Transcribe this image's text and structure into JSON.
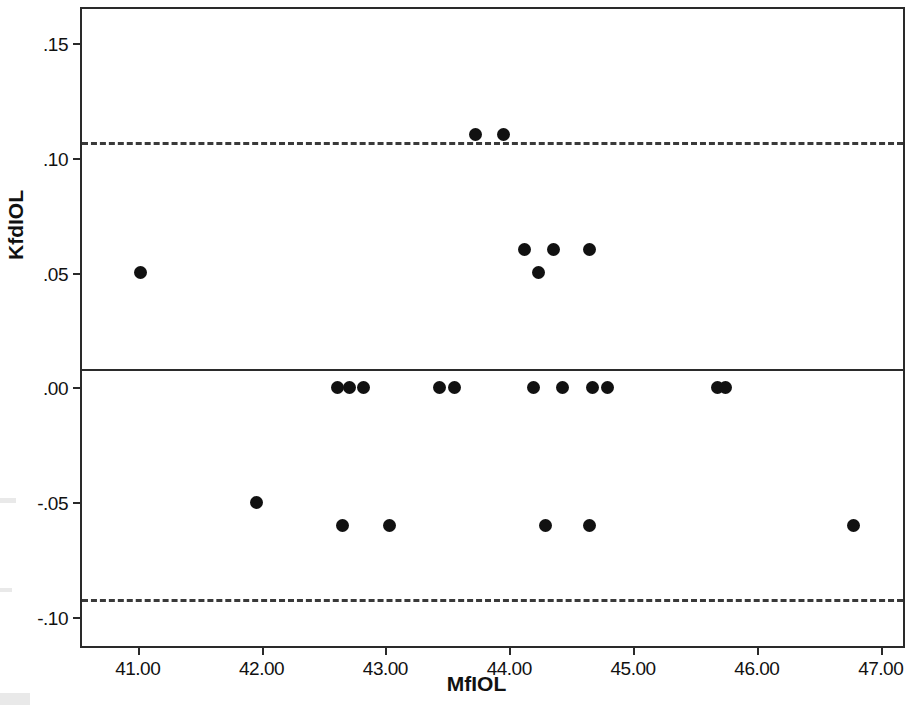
{
  "chart": {
    "type": "scatter",
    "title": "",
    "xlabel": "MfIOL",
    "ylabel": "KfdIOL"
  },
  "axes": {
    "x": {
      "min": 40.55,
      "max": 47.18,
      "ticks": [
        41,
        42,
        43,
        44,
        45,
        46,
        47
      ],
      "tick_labels": [
        "41.00",
        "42.00",
        "43.00",
        "44.00",
        "45.00",
        "46.00",
        "47.00"
      ]
    },
    "y": {
      "min": -0.1125,
      "max": 0.1647,
      "ticks": [
        0.15,
        0.1,
        0.05,
        0.0,
        -0.05,
        -0.1
      ],
      "tick_labels": [
        ".15",
        ".10",
        ".05",
        ".00",
        "-.05",
        "-.10"
      ]
    }
  },
  "reference_lines": [
    {
      "name": "upper-limit-of-agreement",
      "value": 0.107,
      "style": "dashed"
    },
    {
      "name": "mean-difference",
      "value": 0.008,
      "style": "solid"
    },
    {
      "name": "lower-limit-of-agreement",
      "value": -0.092,
      "style": "dashed"
    }
  ],
  "chart_data": {
    "type": "scatter",
    "title": "",
    "xlabel": "MfIOL",
    "ylabel": "KfdIOL",
    "xlim": [
      40.55,
      47.18
    ],
    "ylim": [
      -0.1125,
      0.1647
    ],
    "xticks": [
      41,
      42,
      43,
      44,
      45,
      46,
      47
    ],
    "xtick_labels": [
      "41.00",
      "42.00",
      "43.00",
      "44.00",
      "45.00",
      "46.00",
      "47.00"
    ],
    "yticks": [
      0.15,
      0.1,
      0.05,
      0,
      -0.05,
      -0.1
    ],
    "ytick_labels": [
      ".15",
      ".10",
      ".05",
      ".00",
      "-.05",
      "-.10"
    ],
    "grid": false,
    "legend": "none",
    "marker": "filled-circle",
    "reference_lines": {
      "upper_limit_of_agreement": 0.107,
      "mean": 0.008,
      "lower_limit_of_agreement": -0.092
    },
    "points": [
      {
        "x": 41.02,
        "y": 0.05
      },
      {
        "x": 41.96,
        "y": -0.05
      },
      {
        "x": 42.61,
        "y": 0.0
      },
      {
        "x": 42.71,
        "y": 0.0
      },
      {
        "x": 42.82,
        "y": 0.0
      },
      {
        "x": 42.65,
        "y": -0.06
      },
      {
        "x": 43.03,
        "y": -0.06
      },
      {
        "x": 43.44,
        "y": 0.0
      },
      {
        "x": 43.56,
        "y": 0.0
      },
      {
        "x": 43.73,
        "y": 0.11
      },
      {
        "x": 43.95,
        "y": 0.11
      },
      {
        "x": 44.12,
        "y": 0.06
      },
      {
        "x": 44.24,
        "y": 0.05
      },
      {
        "x": 44.36,
        "y": 0.06
      },
      {
        "x": 44.65,
        "y": 0.06
      },
      {
        "x": 44.2,
        "y": 0.0
      },
      {
        "x": 44.43,
        "y": 0.0
      },
      {
        "x": 44.67,
        "y": 0.0
      },
      {
        "x": 44.79,
        "y": 0.0
      },
      {
        "x": 44.29,
        "y": -0.06
      },
      {
        "x": 44.65,
        "y": -0.06
      },
      {
        "x": 45.68,
        "y": 0.0
      },
      {
        "x": 45.75,
        "y": 0.0
      },
      {
        "x": 46.78,
        "y": -0.06
      }
    ],
    "n_points": 24
  }
}
